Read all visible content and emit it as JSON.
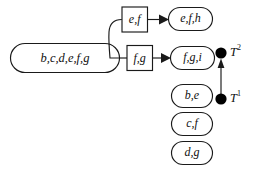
{
  "diagram": {
    "title": "",
    "source_node": {
      "label": "b,c,d,e,f,g"
    },
    "intermediate_nodes": [
      {
        "label": "e,f"
      },
      {
        "label": "f,g"
      }
    ],
    "result_nodes": [
      {
        "label": "e,f,h"
      },
      {
        "label": "f,g,i"
      }
    ],
    "pending_nodes": [
      {
        "label": "b,e"
      },
      {
        "label": "c,f"
      },
      {
        "label": "d,g"
      }
    ],
    "markers": [
      {
        "label": "T",
        "superscript": "2"
      },
      {
        "label": "T",
        "superscript": "1"
      }
    ],
    "colors": {
      "stroke": "#1a1a1a",
      "fill": "#ffffff",
      "dot": "#000000",
      "text": "#101010"
    }
  }
}
